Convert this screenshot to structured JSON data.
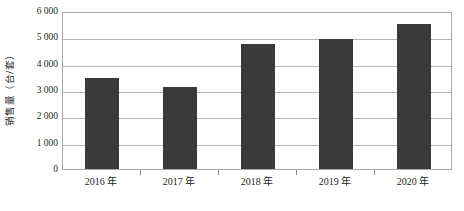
{
  "chart_data": {
    "type": "bar",
    "title": "",
    "xlabel": "",
    "ylabel": "销售量（台/套）",
    "categories": [
      "2016 年",
      "2017 年",
      "2018 年",
      "2019 年",
      "2020 年"
    ],
    "values": [
      3450,
      3100,
      4750,
      4950,
      5500
    ],
    "series": [
      {
        "name": "销售量",
        "values": [
          3450,
          3100,
          4750,
          4950,
          5500
        ]
      }
    ],
    "ylim": [
      0,
      6000
    ],
    "ytick_values": [
      0,
      1000,
      2000,
      3000,
      4000,
      5000,
      6000
    ],
    "ytick_labels": [
      "0",
      "1 000",
      "2 000",
      "3 000",
      "4 000",
      "5 000",
      "6 000"
    ],
    "grid": true,
    "legend": false,
    "legend_position": "none",
    "bar_color": "#3a3a3a",
    "gridline_color": "#b5b5b5",
    "axis_color": "#a9a9a9",
    "background_color": "#ffffff"
  }
}
